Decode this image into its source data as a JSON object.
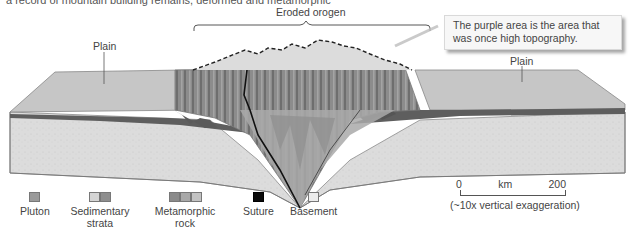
{
  "caption": {
    "text": "a record of mountain building remains, deformed and metamorphic"
  },
  "diagram": {
    "labels": {
      "eroded_orogen": "Eroded orogen",
      "plain_left": "Plain",
      "plain_right": "Plain"
    },
    "callout": {
      "text": "The purple area is the area that was once high topography."
    }
  },
  "legend": {
    "items": [
      {
        "label": "Pluton",
        "swatches": [
          "#9a9a9a"
        ]
      },
      {
        "label": "Sedimentary strata",
        "swatches": [
          "#d4d4d4",
          "#8e8e8e"
        ]
      },
      {
        "label": "Metamorphic rock",
        "swatches": [
          "#8a8a8a",
          "#a8a8a8",
          "#c2c2c2"
        ]
      },
      {
        "label": "Suture",
        "swatches": [
          "#0a0a0a"
        ]
      },
      {
        "label": "Basement",
        "swatches": [
          "#ececec"
        ]
      }
    ]
  },
  "scale": {
    "min": "0",
    "unit": "km",
    "max": "200",
    "note": "(~10x vertical exaggeration)"
  }
}
